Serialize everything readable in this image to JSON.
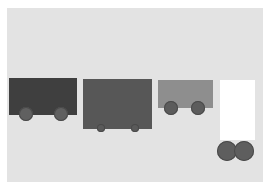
{
  "scene": {
    "background": "#ffffff",
    "stage_color": "#e3e3e3"
  },
  "carts": [
    {
      "id": "cart-1",
      "body_color": "#3f3f3f",
      "wheel_color": "#606060",
      "wheel_size": "large"
    },
    {
      "id": "cart-2",
      "body_color": "#575757",
      "wheel_color": "#5a5a5a",
      "wheel_size": "small"
    },
    {
      "id": "cart-3",
      "body_color": "#8e8e8e",
      "wheel_color": "#5c5c5c",
      "wheel_size": "medium"
    },
    {
      "id": "cart-4",
      "body_color": "#ffffff",
      "wheel_color": "#5e5e5e",
      "wheel_size": "large",
      "wheels_detached": true
    }
  ]
}
